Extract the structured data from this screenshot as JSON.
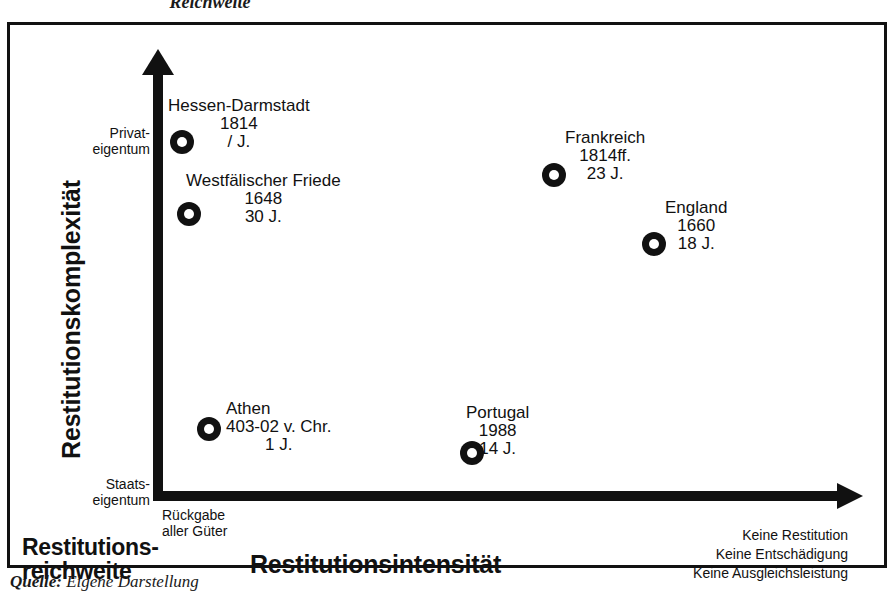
{
  "figure": {
    "top_caption": "Reichweite",
    "source_caption_label": "Quelle:",
    "source_caption_text": " Eigene Darstellung"
  },
  "axes": {
    "y_title": "Restitutionskomplexität",
    "x_title": "Restitutionsintensität",
    "corner_title_line1": "Restitutions-",
    "corner_title_line2": "reichweite",
    "y_top_label_line1": "Privat-",
    "y_top_label_line2": "eigentum",
    "y_bottom_label_line1": "Staats-",
    "y_bottom_label_line2": "eigentum",
    "x_origin_label_line1": "Rückgabe",
    "x_origin_label_line2": "aller Güter",
    "x_end_label_line1": "Keine Restitution",
    "x_end_label_line2": "Keine Entschädigung",
    "x_end_label_line3": "Keine Ausgleichsleistung"
  },
  "chart_data": {
    "type": "scatter",
    "title": "Reichweite",
    "xlabel": "Restitutionsintensität",
    "ylabel": "Restitutionskomplexität",
    "xlim_labels": [
      "Rückgabe aller Güter",
      "Keine Restitution / Keine Entschädigung / Keine Ausgleichsleistung"
    ],
    "ylim_labels": [
      "Staatseigentum",
      "Privateigentum"
    ],
    "grid": false,
    "legend": "none",
    "points": [
      {
        "name": "Hessen-Darmstadt",
        "year": "1814",
        "duration": "/ J.",
        "x_px": 182,
        "y_px": 142,
        "label_x_px": 168,
        "label_y_px": 97,
        "label_align": "left"
      },
      {
        "name": "Westfälischer Friede",
        "year": "1648",
        "duration": "30 J.",
        "x_px": 189,
        "y_px": 214,
        "label_x_px": 186,
        "label_y_px": 172,
        "label_align": "left"
      },
      {
        "name": "Frankreich",
        "year": "1814ff.",
        "duration": "23 J.",
        "x_px": 554,
        "y_px": 175,
        "label_x_px": 565,
        "label_y_px": 129,
        "label_align": "left"
      },
      {
        "name": "England",
        "year": "1660",
        "duration": "18 J.",
        "x_px": 654,
        "y_px": 244,
        "label_x_px": 665,
        "label_y_px": 199,
        "label_align": "left"
      },
      {
        "name": "Athen",
        "year": "403-02 v. Chr.",
        "duration": "1 J.",
        "x_px": 209,
        "y_px": 429,
        "label_x_px": 226,
        "label_y_px": 400,
        "label_align": "left"
      },
      {
        "name": "Portugal",
        "year": "1988",
        "duration": "14 J.",
        "x_px": 472,
        "y_px": 453,
        "label_x_px": 466,
        "label_y_px": 404,
        "label_align": "left"
      }
    ]
  }
}
